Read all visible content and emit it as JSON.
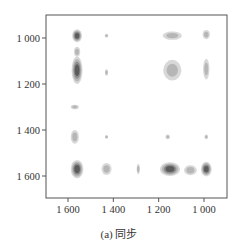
{
  "chart_data": {
    "type": "heatmap",
    "subtype": "2D correlation synchronous contour map",
    "title": "",
    "caption": "(a) 同步",
    "xlabel": "",
    "ylabel": "",
    "x_reversed": true,
    "y_reversed": true,
    "xlim": [
      1690,
      920
    ],
    "ylim": [
      940,
      1700
    ],
    "x_ticks": [
      1600,
      1400,
      1200,
      1000
    ],
    "x_tick_labels": [
      "1 600",
      "1 400",
      "1 200",
      "1 000"
    ],
    "y_ticks": [
      1000,
      1200,
      1400,
      1600
    ],
    "y_tick_labels": [
      "1 000",
      "1 200",
      "1 400",
      "1 600"
    ],
    "grid": false,
    "peaks": [
      {
        "x": 1560,
        "y": 990,
        "rx": 22,
        "ry": 28,
        "intensity": 3
      },
      {
        "x": 1560,
        "y": 1060,
        "rx": 14,
        "ry": 22,
        "intensity": 1
      },
      {
        "x": 1560,
        "y": 1140,
        "rx": 24,
        "ry": 60,
        "intensity": 3
      },
      {
        "x": 1570,
        "y": 1300,
        "rx": 18,
        "ry": 10,
        "intensity": 1
      },
      {
        "x": 1570,
        "y": 1430,
        "rx": 18,
        "ry": 30,
        "intensity": 1
      },
      {
        "x": 1560,
        "y": 1570,
        "rx": 28,
        "ry": 40,
        "intensity": 3
      },
      {
        "x": 1430,
        "y": 990,
        "rx": 8,
        "ry": 8,
        "intensity": 1
      },
      {
        "x": 1430,
        "y": 1150,
        "rx": 7,
        "ry": 14,
        "intensity": 1
      },
      {
        "x": 1430,
        "y": 1430,
        "rx": 7,
        "ry": 8,
        "intensity": 1
      },
      {
        "x": 1430,
        "y": 1570,
        "rx": 22,
        "ry": 26,
        "intensity": 1
      },
      {
        "x": 1290,
        "y": 1570,
        "rx": 7,
        "ry": 22,
        "intensity": 1
      },
      {
        "x": 1140,
        "y": 990,
        "rx": 42,
        "ry": 18,
        "intensity": 1
      },
      {
        "x": 1140,
        "y": 1140,
        "rx": 40,
        "ry": 45,
        "intensity": 1
      },
      {
        "x": 1160,
        "y": 1430,
        "rx": 10,
        "ry": 10,
        "intensity": 1
      },
      {
        "x": 1150,
        "y": 1570,
        "rx": 45,
        "ry": 30,
        "intensity": 3
      },
      {
        "x": 1060,
        "y": 1575,
        "rx": 28,
        "ry": 22,
        "intensity": 1
      },
      {
        "x": 990,
        "y": 985,
        "rx": 16,
        "ry": 20,
        "intensity": 1
      },
      {
        "x": 990,
        "y": 1135,
        "rx": 14,
        "ry": 45,
        "intensity": 1
      },
      {
        "x": 990,
        "y": 1430,
        "rx": 8,
        "ry": 10,
        "intensity": 1
      },
      {
        "x": 990,
        "y": 1570,
        "rx": 24,
        "ry": 32,
        "intensity": 3
      }
    ]
  },
  "caption": "(a) 同步"
}
